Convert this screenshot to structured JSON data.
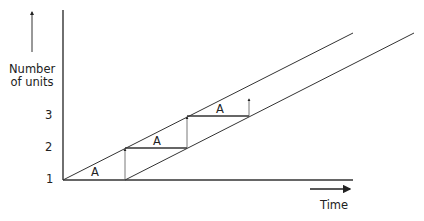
{
  "diagram": {
    "y_axis_label": [
      "Number",
      "of units"
    ],
    "x_axis_label": "Time",
    "y_ticks": [
      "1",
      "2",
      "3"
    ],
    "step_labels": [
      "A",
      "A",
      "A"
    ],
    "line_color": "#333333"
  }
}
